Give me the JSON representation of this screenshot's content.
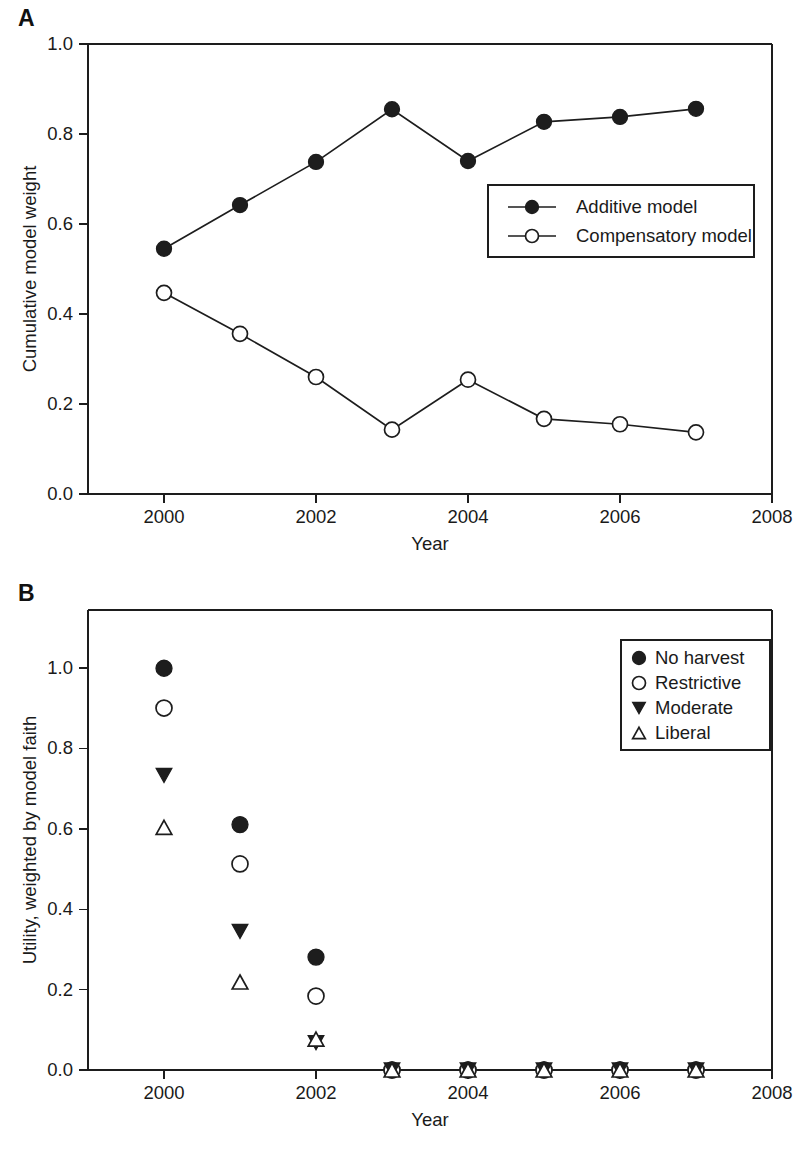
{
  "figure": {
    "background_color": "#ffffff",
    "ink_color": "#1d1d1d"
  },
  "panels": [
    {
      "letter": "A",
      "name": "cumulative-model-weight"
    },
    {
      "letter": "B",
      "name": "weighted-utility"
    }
  ],
  "chart_data": [
    {
      "type": "line",
      "panel": "A",
      "title": "",
      "xlabel": "Year",
      "ylabel": "Cumulative model weight",
      "x": [
        2000,
        2001,
        2002,
        2003,
        2004,
        2005,
        2006,
        2007
      ],
      "xlim": [
        1999,
        2008
      ],
      "ylim": [
        0.0,
        1.0
      ],
      "xticks": [
        2000,
        2002,
        2004,
        2006,
        2008
      ],
      "xtick_labels": [
        "2000",
        "2002",
        "2004",
        "2006",
        "2008"
      ],
      "yticks": [
        0.0,
        0.2,
        0.4,
        0.6,
        0.8,
        1.0
      ],
      "ytick_labels": [
        "0.0",
        "0.2",
        "0.4",
        "0.6",
        "0.8",
        "1.0"
      ],
      "grid": false,
      "legend_position": "center-right",
      "series": [
        {
          "name": "Additive model",
          "marker": "filled-circle",
          "values": [
            0.545,
            0.642,
            0.738,
            0.855,
            0.74,
            0.827,
            0.838,
            0.856
          ]
        },
        {
          "name": "Compensatory model",
          "marker": "open-circle",
          "values": [
            0.447,
            0.356,
            0.26,
            0.143,
            0.254,
            0.167,
            0.155,
            0.137
          ]
        }
      ]
    },
    {
      "type": "scatter",
      "panel": "B",
      "title": "",
      "xlabel": "Year",
      "ylabel": "Utility, weighted by model faith",
      "x": [
        2000,
        2001,
        2002,
        2003,
        2004,
        2005,
        2006,
        2007
      ],
      "xlim": [
        1999,
        2008
      ],
      "ylim": [
        0.0,
        1.12
      ],
      "xticks": [
        2000,
        2002,
        2004,
        2006,
        2008
      ],
      "xtick_labels": [
        "2000",
        "2002",
        "2004",
        "2006",
        "2008"
      ],
      "yticks": [
        0.0,
        0.2,
        0.4,
        0.6,
        0.8,
        1.0
      ],
      "ytick_labels": [
        "0.0",
        "0.2",
        "0.4",
        "0.6",
        "0.8",
        "1.0"
      ],
      "grid": false,
      "legend_position": "top-right",
      "series": [
        {
          "name": "No harvest",
          "marker": "filled-circle",
          "values": [
            1.0,
            0.611,
            0.281,
            0.0,
            0.0,
            0.0,
            0.0,
            0.0
          ]
        },
        {
          "name": "Restrictive",
          "marker": "open-circle",
          "values": [
            0.901,
            0.513,
            0.184,
            0.0,
            0.0,
            0.0,
            0.0,
            0.0
          ]
        },
        {
          "name": "Moderate",
          "marker": "filled-triangle-down",
          "values": [
            0.733,
            0.345,
            0.068,
            0.0,
            0.0,
            0.0,
            0.0,
            0.0
          ]
        },
        {
          "name": "Liberal",
          "marker": "open-triangle-up",
          "values": [
            0.604,
            0.219,
            0.077,
            0.0,
            0.0,
            0.0,
            0.0,
            0.0
          ]
        }
      ]
    }
  ]
}
